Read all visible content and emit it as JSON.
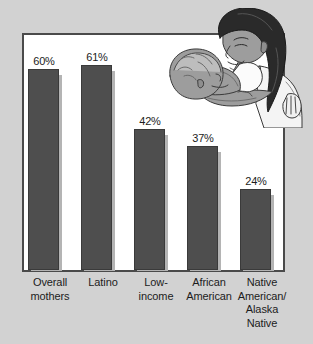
{
  "figure": {
    "name": "breastfeeding-rates-bar-chart",
    "background_color": "#d2d2d2",
    "plot_background_color": "#ffffff",
    "plot_border_color": "#4a4a4a",
    "bar_color": "#4e4e4e",
    "bar_shadow_color": "#b4b4b4",
    "text_color": "#1c1c1c"
  },
  "illustration": {
    "name": "mother-breastfeeding-baby-illustration",
    "skin_color": "#9a9a9a",
    "hair_color": "#2a2a2a",
    "cloth_color": "#f2f2f2",
    "outline_color": "#3a3a3a"
  },
  "chart_data": {
    "type": "bar",
    "title": "",
    "subtitle": "",
    "xlabel": "",
    "ylabel": "",
    "ylim": [
      0,
      70
    ],
    "grid": false,
    "legend": "none",
    "categories": [
      "Overall mothers",
      "Latino",
      "Low-income",
      "African American",
      "Native American/ Alaska Native"
    ],
    "category_lines": [
      [
        "Overall",
        "mothers"
      ],
      [
        "Latino"
      ],
      [
        "Low-",
        "income"
      ],
      [
        "African",
        "American"
      ],
      [
        "Native",
        "American/",
        "Alaska",
        "Native"
      ]
    ],
    "values": [
      60,
      61,
      42,
      37,
      24
    ],
    "value_labels": [
      "60%",
      "61%",
      "42%",
      "37%",
      "24%"
    ]
  }
}
